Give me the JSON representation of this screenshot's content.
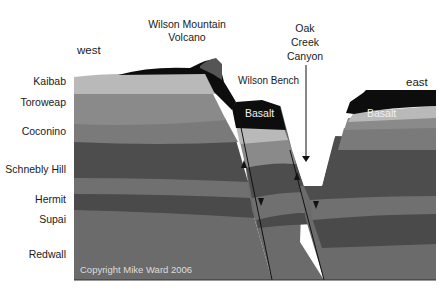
{
  "title_labels": {
    "volcano": "Wilson Mountain\nVolcano",
    "volcano_line1": "Wilson Mountain",
    "volcano_line2": "Volcano",
    "canyon_line1": "Oak",
    "canyon_line2": "Creek",
    "canyon_line3": "Canyon",
    "bench": "Wilson Bench",
    "west": "west",
    "east": "east",
    "basalt_left": "Basalt",
    "basalt_right": "Basalt",
    "copyright": "Copyright Mike Ward 2006"
  },
  "strata": [
    {
      "name": "Kaibab",
      "color": "#b9b9b9"
    },
    {
      "name": "Toroweap",
      "color": "#8a8a8a"
    },
    {
      "name": "Coconino",
      "color": "#7a7a7a"
    },
    {
      "name": "Schnebly Hill",
      "color": "#4d4d4d"
    },
    {
      "name": "Hermit",
      "color": "#707070"
    },
    {
      "name": "Supai",
      "color": "#4a4a4a"
    },
    {
      "name": "Redwall",
      "color": "#6b6b6b"
    }
  ],
  "colors": {
    "basalt": "#0d0d0d",
    "line": "#111111",
    "vent": "#555555"
  }
}
